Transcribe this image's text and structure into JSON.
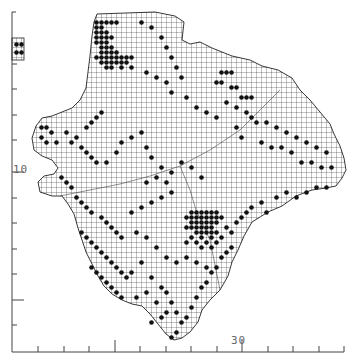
{
  "map": {
    "type": "grid distribution map",
    "grid_cell_px": 5,
    "colors": {
      "ink": "#111111",
      "grid": "#333333",
      "axis": "#444444",
      "background": "#ffffff"
    },
    "axes": {
      "y_label": "10",
      "x_label": "30",
      "x_ticks_px": [
        38,
        64,
        89,
        115,
        140,
        166,
        191,
        217,
        242,
        268,
        293,
        319,
        344
      ],
      "x_major_ticks_px": [
        115,
        242
      ],
      "y_ticks_px": [
        64,
        89,
        115,
        140,
        172,
        198,
        223,
        249,
        274,
        300,
        325
      ],
      "y_major_ticks_px": [
        172,
        300
      ]
    },
    "inset": {
      "x": 14,
      "y": 38,
      "w": 10,
      "h": 22,
      "label": "inset-island"
    },
    "outline": [
      [
        97,
        14
      ],
      [
        155,
        12
      ],
      [
        175,
        16
      ],
      [
        184,
        22
      ],
      [
        182,
        40
      ],
      [
        190,
        44
      ],
      [
        200,
        42
      ],
      [
        212,
        48
      ],
      [
        232,
        56
      ],
      [
        250,
        60
      ],
      [
        262,
        66
      ],
      [
        278,
        70
      ],
      [
        292,
        78
      ],
      [
        300,
        90
      ],
      [
        310,
        100
      ],
      [
        320,
        112
      ],
      [
        330,
        124
      ],
      [
        334,
        134
      ],
      [
        340,
        146
      ],
      [
        344,
        158
      ],
      [
        346,
        170
      ],
      [
        342,
        178
      ],
      [
        336,
        186
      ],
      [
        326,
        188
      ],
      [
        312,
        190
      ],
      [
        296,
        196
      ],
      [
        282,
        206
      ],
      [
        268,
        212
      ],
      [
        252,
        222
      ],
      [
        244,
        236
      ],
      [
        238,
        250
      ],
      [
        232,
        262
      ],
      [
        228,
        276
      ],
      [
        220,
        290
      ],
      [
        210,
        300
      ],
      [
        202,
        310
      ],
      [
        198,
        322
      ],
      [
        190,
        332
      ],
      [
        182,
        338
      ],
      [
        174,
        340
      ],
      [
        166,
        334
      ],
      [
        158,
        324
      ],
      [
        150,
        314
      ],
      [
        142,
        306
      ],
      [
        132,
        304
      ],
      [
        122,
        300
      ],
      [
        112,
        294
      ],
      [
        104,
        286
      ],
      [
        98,
        276
      ],
      [
        92,
        264
      ],
      [
        86,
        252
      ],
      [
        82,
        240
      ],
      [
        78,
        228
      ],
      [
        74,
        214
      ],
      [
        68,
        204
      ],
      [
        62,
        196
      ],
      [
        52,
        196
      ],
      [
        40,
        192
      ],
      [
        38,
        182
      ],
      [
        44,
        176
      ],
      [
        54,
        174
      ],
      [
        58,
        168
      ],
      [
        52,
        160
      ],
      [
        42,
        156
      ],
      [
        34,
        150
      ],
      [
        32,
        138
      ],
      [
        36,
        126
      ],
      [
        42,
        118
      ],
      [
        52,
        116
      ],
      [
        62,
        112
      ],
      [
        72,
        108
      ],
      [
        80,
        100
      ],
      [
        86,
        88
      ],
      [
        88,
        72
      ],
      [
        90,
        56
      ],
      [
        92,
        36
      ],
      [
        94,
        22
      ]
    ],
    "occupied_cells": [
      [
        96,
        22
      ],
      [
        101,
        22
      ],
      [
        106,
        22
      ],
      [
        111,
        22
      ],
      [
        116,
        22
      ],
      [
        96,
        27
      ],
      [
        101,
        27
      ],
      [
        96,
        32
      ],
      [
        101,
        32
      ],
      [
        106,
        32
      ],
      [
        96,
        37
      ],
      [
        101,
        37
      ],
      [
        106,
        37
      ],
      [
        111,
        37
      ],
      [
        96,
        42
      ],
      [
        101,
        42
      ],
      [
        106,
        42
      ],
      [
        101,
        47
      ],
      [
        106,
        47
      ],
      [
        111,
        47
      ],
      [
        101,
        52
      ],
      [
        106,
        52
      ],
      [
        111,
        52
      ],
      [
        116,
        52
      ],
      [
        96,
        57
      ],
      [
        101,
        57
      ],
      [
        106,
        57
      ],
      [
        111,
        57
      ],
      [
        116,
        57
      ],
      [
        121,
        57
      ],
      [
        126,
        57
      ],
      [
        131,
        57
      ],
      [
        101,
        62
      ],
      [
        106,
        62
      ],
      [
        111,
        62
      ],
      [
        116,
        62
      ],
      [
        121,
        62
      ],
      [
        126,
        62
      ],
      [
        106,
        67
      ],
      [
        111,
        67
      ],
      [
        121,
        67
      ],
      [
        131,
        67
      ],
      [
        141,
        22
      ],
      [
        151,
        27
      ],
      [
        161,
        37
      ],
      [
        166,
        47
      ],
      [
        171,
        57
      ],
      [
        176,
        67
      ],
      [
        146,
        72
      ],
      [
        156,
        77
      ],
      [
        166,
        82
      ],
      [
        181,
        77
      ],
      [
        171,
        92
      ],
      [
        186,
        97
      ],
      [
        196,
        107
      ],
      [
        206,
        112
      ],
      [
        216,
        117
      ],
      [
        226,
        102
      ],
      [
        236,
        107
      ],
      [
        246,
        112
      ],
      [
        251,
        117
      ],
      [
        256,
        122
      ],
      [
        266,
        122
      ],
      [
        276,
        127
      ],
      [
        286,
        132
      ],
      [
        296,
        137
      ],
      [
        306,
        142
      ],
      [
        316,
        147
      ],
      [
        326,
        152
      ],
      [
        221,
        72
      ],
      [
        226,
        72
      ],
      [
        231,
        72
      ],
      [
        216,
        82
      ],
      [
        221,
        82
      ],
      [
        231,
        87
      ],
      [
        236,
        87
      ],
      [
        241,
        97
      ],
      [
        246,
        97
      ],
      [
        251,
        97
      ],
      [
        236,
        127
      ],
      [
        241,
        137
      ],
      [
        261,
        142
      ],
      [
        271,
        147
      ],
      [
        281,
        147
      ],
      [
        291,
        152
      ],
      [
        301,
        162
      ],
      [
        311,
        162
      ],
      [
        321,
        167
      ],
      [
        331,
        167
      ],
      [
        41,
        127
      ],
      [
        46,
        127
      ],
      [
        51,
        132
      ],
      [
        41,
        137
      ],
      [
        46,
        142
      ],
      [
        56,
        142
      ],
      [
        66,
        132
      ],
      [
        76,
        137
      ],
      [
        86,
        127
      ],
      [
        91,
        122
      ],
      [
        96,
        117
      ],
      [
        101,
        112
      ],
      [
        71,
        142
      ],
      [
        81,
        147
      ],
      [
        86,
        152
      ],
      [
        91,
        157
      ],
      [
        96,
        162
      ],
      [
        106,
        162
      ],
      [
        116,
        152
      ],
      [
        121,
        142
      ],
      [
        131,
        137
      ],
      [
        141,
        132
      ],
      [
        146,
        147
      ],
      [
        151,
        157
      ],
      [
        161,
        167
      ],
      [
        171,
        172
      ],
      [
        181,
        162
      ],
      [
        191,
        167
      ],
      [
        201,
        177
      ],
      [
        61,
        177
      ],
      [
        66,
        182
      ],
      [
        71,
        187
      ],
      [
        76,
        197
      ],
      [
        81,
        202
      ],
      [
        86,
        207
      ],
      [
        91,
        212
      ],
      [
        101,
        217
      ],
      [
        106,
        222
      ],
      [
        111,
        227
      ],
      [
        116,
        232
      ],
      [
        121,
        237
      ],
      [
        81,
        232
      ],
      [
        86,
        237
      ],
      [
        91,
        242
      ],
      [
        96,
        247
      ],
      [
        101,
        252
      ],
      [
        106,
        257
      ],
      [
        111,
        262
      ],
      [
        116,
        267
      ],
      [
        121,
        272
      ],
      [
        126,
        277
      ],
      [
        91,
        267
      ],
      [
        96,
        272
      ],
      [
        101,
        277
      ],
      [
        106,
        282
      ],
      [
        111,
        287
      ],
      [
        116,
        292
      ],
      [
        121,
        297
      ],
      [
        131,
        272
      ],
      [
        141,
        262
      ],
      [
        151,
        277
      ],
      [
        161,
        287
      ],
      [
        166,
        292
      ],
      [
        171,
        302
      ],
      [
        176,
        312
      ],
      [
        181,
        322
      ],
      [
        176,
        332
      ],
      [
        171,
        337
      ],
      [
        186,
        317
      ],
      [
        191,
        307
      ],
      [
        196,
        297
      ],
      [
        201,
        287
      ],
      [
        206,
        282
      ],
      [
        211,
        272
      ],
      [
        216,
        267
      ],
      [
        221,
        257
      ],
      [
        226,
        252
      ],
      [
        231,
        247
      ],
      [
        191,
        212
      ],
      [
        196,
        212
      ],
      [
        201,
        212
      ],
      [
        206,
        212
      ],
      [
        211,
        212
      ],
      [
        216,
        212
      ],
      [
        186,
        217
      ],
      [
        191,
        217
      ],
      [
        196,
        217
      ],
      [
        201,
        217
      ],
      [
        206,
        217
      ],
      [
        211,
        217
      ],
      [
        216,
        217
      ],
      [
        221,
        217
      ],
      [
        191,
        222
      ],
      [
        196,
        222
      ],
      [
        201,
        222
      ],
      [
        206,
        222
      ],
      [
        211,
        222
      ],
      [
        216,
        222
      ],
      [
        186,
        227
      ],
      [
        191,
        227
      ],
      [
        196,
        227
      ],
      [
        201,
        227
      ],
      [
        206,
        227
      ],
      [
        211,
        227
      ],
      [
        196,
        232
      ],
      [
        201,
        232
      ],
      [
        206,
        232
      ],
      [
        211,
        232
      ],
      [
        216,
        232
      ],
      [
        191,
        237
      ],
      [
        201,
        237
      ],
      [
        211,
        237
      ],
      [
        186,
        242
      ],
      [
        196,
        242
      ],
      [
        206,
        242
      ],
      [
        216,
        242
      ],
      [
        201,
        247
      ],
      [
        211,
        247
      ],
      [
        221,
        237
      ],
      [
        226,
        227
      ],
      [
        231,
        232
      ],
      [
        236,
        222
      ],
      [
        241,
        217
      ],
      [
        246,
        212
      ],
      [
        251,
        207
      ],
      [
        261,
        202
      ],
      [
        266,
        212
      ],
      [
        276,
        197
      ],
      [
        286,
        192
      ],
      [
        296,
        197
      ],
      [
        306,
        192
      ],
      [
        316,
        187
      ],
      [
        326,
        187
      ],
      [
        171,
        192
      ],
      [
        161,
        197
      ],
      [
        151,
        202
      ],
      [
        141,
        207
      ],
      [
        131,
        212
      ],
      [
        146,
        182
      ],
      [
        156,
        177
      ],
      [
        166,
        182
      ],
      [
        136,
        232
      ],
      [
        146,
        237
      ],
      [
        156,
        247
      ],
      [
        166,
        257
      ],
      [
        176,
        262
      ],
      [
        186,
        257
      ],
      [
        196,
        262
      ],
      [
        206,
        267
      ],
      [
        136,
        297
      ],
      [
        146,
        292
      ],
      [
        156,
        302
      ],
      [
        166,
        312
      ],
      [
        151,
        322
      ],
      [
        161,
        317
      ],
      [
        16,
        44
      ],
      [
        21,
        44
      ],
      [
        16,
        52
      ],
      [
        21,
        52
      ]
    ]
  }
}
